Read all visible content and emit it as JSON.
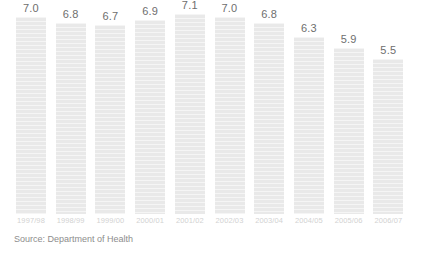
{
  "chart_data": {
    "type": "bar",
    "title": "",
    "subtitle": "",
    "xlabel": "",
    "ylabel": "",
    "ylim": [
      0,
      7.6
    ],
    "grid": false,
    "legend": "none",
    "bar_color": "#e9e9e9",
    "value_label_color": "#6e6e6e",
    "category_label_color": "#d2d2d2",
    "source_color": "#8d8d8d",
    "categories": [
      "1997/98",
      "1998/99",
      "1999/00",
      "2000/01",
      "2001/02",
      "2002/03",
      "2003/04",
      "2004/05",
      "2005/06",
      "2006/07"
    ],
    "values": [
      7.0,
      6.8,
      6.7,
      6.9,
      7.1,
      7.0,
      6.8,
      6.3,
      5.9,
      5.5
    ],
    "value_labels": [
      "7.0",
      "6.8",
      "6.7",
      "6.9",
      "7.1",
      "7.0",
      "6.8",
      "6.3",
      "5.9",
      "5.5"
    ],
    "annotations": [
      "Source: Department of Health"
    ]
  },
  "source": {
    "text": "Source: Department of Health"
  }
}
